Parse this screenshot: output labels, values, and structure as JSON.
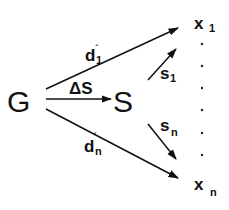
{
  "diagram": {
    "type": "flow-diagram",
    "nodes": {
      "G": {
        "label": "G"
      },
      "S": {
        "label": "S"
      },
      "x1": {
        "label": "x",
        "subscript": "1"
      },
      "xn": {
        "label": "x",
        "subscript": "n"
      }
    },
    "edges": [
      {
        "id": "d1",
        "from": "G",
        "to": "x1",
        "label": "d",
        "prime": "´",
        "subscript": "1"
      },
      {
        "id": "dS",
        "from": "G",
        "to": "S",
        "label": "ΔS"
      },
      {
        "id": "dn",
        "from": "G",
        "to": "xn",
        "label": "d",
        "prime": "´",
        "subscript": "n"
      },
      {
        "id": "s1",
        "from": "S",
        "to": "x1",
        "label": "s",
        "subscript": "1"
      },
      {
        "id": "sn",
        "from": "S",
        "to": "xn",
        "label": "s",
        "subscript": "n"
      }
    ],
    "ellipsis": "·",
    "ellipsis_count": 6
  }
}
